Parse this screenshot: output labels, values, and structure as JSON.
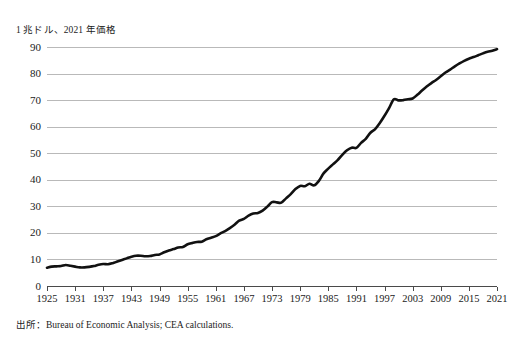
{
  "chart_data": {
    "type": "line",
    "title": "",
    "ylabel": "1 兆ドル、2021 年価格",
    "xlabel": "",
    "source_note": "出所：Bureau of Economic Analysis; CEA calculations.",
    "ylim": [
      0,
      90
    ],
    "xlim": [
      1925,
      2021
    ],
    "ytick_labels": [
      "90",
      "80",
      "70",
      "60",
      "50",
      "40",
      "30",
      "20",
      "10",
      "0"
    ],
    "ytick_values": [
      90,
      80,
      70,
      60,
      50,
      40,
      30,
      20,
      10,
      0
    ],
    "xtick_labels": [
      "1925",
      "1931",
      "1937",
      "1943",
      "1949",
      "1955",
      "1961",
      "1967",
      "1973",
      "1979",
      "1985",
      "1991",
      "1997",
      "2003",
      "2009",
      "2015",
      "2021"
    ],
    "xtick_values": [
      1925,
      1931,
      1937,
      1943,
      1949,
      1955,
      1961,
      1967,
      1973,
      1979,
      1985,
      1991,
      1997,
      2003,
      2009,
      2015,
      2021
    ],
    "grid": true,
    "legend": "none",
    "line_color": "#111111",
    "line_width": 2.6,
    "series": [
      {
        "name": "実質GDP",
        "x": [
          1925,
          1926,
          1927,
          1928,
          1929,
          1930,
          1931,
          1932,
          1933,
          1934,
          1935,
          1936,
          1937,
          1938,
          1939,
          1940,
          1941,
          1942,
          1943,
          1944,
          1945,
          1946,
          1947,
          1948,
          1949,
          1950,
          1951,
          1952,
          1953,
          1954,
          1955,
          1956,
          1957,
          1958,
          1959,
          1960,
          1961,
          1962,
          1963,
          1964,
          1965,
          1966,
          1967,
          1968,
          1969,
          1970,
          1971,
          1972,
          1973,
          1974,
          1975,
          1976,
          1977,
          1978,
          1979,
          1980,
          1981,
          1982,
          1983,
          1984,
          1985,
          1986,
          1987,
          1988,
          1989,
          1990,
          1991,
          1992,
          1993,
          1994,
          1995,
          1996,
          1997,
          1998,
          1999,
          2000,
          2001,
          2002,
          2003,
          2004,
          2005,
          2006,
          2007,
          2008,
          2009,
          2010,
          2011,
          2012,
          2013,
          2014,
          2015,
          2016,
          2017,
          2018,
          2019,
          2020,
          2021
        ],
        "values": [
          6.6,
          7.0,
          7.1,
          7.2,
          7.7,
          7.0,
          6.5,
          5.7,
          5.6,
          6.2,
          6.7,
          7.6,
          8.0,
          7.7,
          8.3,
          9.0,
          10.6,
          12.6,
          14.7,
          15.9,
          15.7,
          13.9,
          13.8,
          14.4,
          14.3,
          15.6,
          16.8,
          17.4,
          18.2,
          18.1,
          19.4,
          19.8,
          20.2,
          20.0,
          21.5,
          22.0,
          22.5,
          23.9,
          25.0,
          26.4,
          28.1,
          30.0,
          30.7,
          32.2,
          33.2,
          33.3,
          34.4,
          36.2,
          38.3,
          38.1,
          38.0,
          40.0,
          41.9,
          44.2,
          45.6,
          45.5,
          46.6,
          45.8,
          47.9,
          51.3,
          53.5,
          55.4,
          57.3,
          59.7,
          61.8,
          63.0,
          62.9,
          65.2,
          67.0,
          69.8,
          71.5,
          74.2,
          77.5,
          81.1,
          85.0,
          88.4,
          89.1,
          90.8,
          93.4,
          97.0,
          100.1,
          103.0,
          105.0,
          104.8,
          101.8,
          104.5,
          106.2,
          108.7,
          110.7,
          113.5,
          117.0,
          119.0,
          121.8,
          125.4,
          128.4,
          124.8,
          133.0
        ]
      }
    ],
    "series_plot_values": [
      6.9,
      7.3,
      7.4,
      7.5,
      7.9,
      7.6,
      7.3,
      7.0,
      7.0,
      7.2,
      7.5,
      8.0,
      8.3,
      8.2,
      8.6,
      9.2,
      9.8,
      10.4,
      11.0,
      11.4,
      11.4,
      11.2,
      11.3,
      11.7,
      11.9,
      12.7,
      13.4,
      13.9,
      14.5,
      14.7,
      15.7,
      16.2,
      16.6,
      16.7,
      17.6,
      18.2,
      18.8,
      19.8,
      20.7,
      21.8,
      23.1,
      24.6,
      25.3,
      26.5,
      27.3,
      27.5,
      28.4,
      29.9,
      31.6,
      31.5,
      31.4,
      33.0,
      34.6,
      36.5,
      37.7,
      37.6,
      38.5,
      37.9,
      39.6,
      42.4,
      44.2,
      45.8,
      47.4,
      49.4,
      51.1,
      52.1,
      52.0,
      53.9,
      55.4,
      57.7,
      59.1,
      61.4,
      64.1,
      67.1,
      70.3,
      69.9,
      70.0,
      70.3,
      70.6,
      72.0,
      73.6,
      75.1,
      76.4,
      77.6,
      79.0,
      80.4,
      81.5,
      82.7,
      83.8,
      84.8,
      85.6,
      86.2,
      86.9,
      87.6,
      88.2,
      88.6,
      89.2
    ]
  }
}
